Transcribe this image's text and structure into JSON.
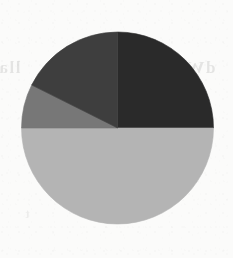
{
  "figure": {
    "kind": "pie-chart",
    "medium": "scanned-page",
    "background_color": "#fbfbfa",
    "center_x": 117.5,
    "center_y": 128,
    "radius": 96,
    "start_angle_deg": 0,
    "direction": "clockwise"
  },
  "bleed_through_text": {
    "left": "lla",
    "right": "dW",
    "lower": "t"
  },
  "chart_data": {
    "type": "pie",
    "title": "",
    "subtitle": "",
    "xlabel": "",
    "ylabel": "",
    "grid": false,
    "legend": "none",
    "labels_shown": false,
    "values_shown": false,
    "total": 100,
    "units": "percent",
    "start_angle_deg": 0,
    "direction": "clockwise",
    "categories": [
      "Segment 1",
      "Segment 2",
      "Segment 3",
      "Segment 4"
    ],
    "values": [
      25,
      50,
      7.4,
      17.6
    ],
    "colors": [
      "#2a2a2a",
      "#b4b4b4",
      "#777777",
      "#3e3e3e"
    ],
    "slices": [
      {
        "index": 1,
        "label": "Segment 1",
        "value": 25,
        "percent": "25%",
        "color": "#2a2a2a",
        "shade": "near-black",
        "start_angle_deg": 0,
        "end_angle_deg": 90,
        "sweep_deg": 90,
        "position": "upper-right quadrant"
      },
      {
        "index": 2,
        "label": "Segment 2",
        "value": 50,
        "percent": "50%",
        "color": "#b4b4b4",
        "shade": "light-gray",
        "start_angle_deg": 90,
        "end_angle_deg": 270,
        "sweep_deg": 180,
        "position": "lower half"
      },
      {
        "index": 3,
        "label": "Segment 3",
        "value": 7.4,
        "percent": "7.4%",
        "color": "#777777",
        "shade": "medium-gray",
        "start_angle_deg": 270,
        "end_angle_deg": 296.6,
        "sweep_deg": 26.6,
        "position": "left, just above horizontal"
      },
      {
        "index": 4,
        "label": "Segment 4",
        "value": 17.6,
        "percent": "17.6%",
        "color": "#3e3e3e",
        "shade": "dark-gray",
        "start_angle_deg": 296.6,
        "end_angle_deg": 360,
        "sweep_deg": 63.4,
        "position": "upper-left quadrant"
      }
    ]
  }
}
